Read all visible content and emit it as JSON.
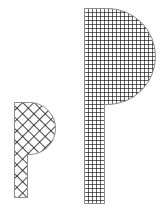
{
  "document": {
    "title": "Hatched P Glyphs",
    "background_color": "#ffffff",
    "width": 164,
    "height": 212
  },
  "chart_data": {
    "type": "diagram",
    "title": "",
    "xlabel": "",
    "ylabel": "",
    "background": "#ffffff",
    "shape_count": 2,
    "shapes": [
      {
        "id": "small-p",
        "label": "P",
        "role": "letterform",
        "pattern": "diagonal-crosshatch",
        "pattern_angle_degrees": 45,
        "pattern_pitch_px": 8,
        "stroke_color": "#1a1a1a",
        "stroke_width_px": 1.6,
        "outline_color": "#8c8c8c",
        "outline_width_px": 1,
        "fill_color": "#ffffff",
        "bbox": {
          "x": 14,
          "y": 102,
          "width": 41,
          "height": 96
        },
        "stem": {
          "x": 14,
          "y": 102,
          "width": 13,
          "height": 96
        },
        "bowl": {
          "x": 14,
          "y": 102,
          "width": 41,
          "height": 53,
          "right_radius": 26
        }
      },
      {
        "id": "large-p",
        "label": "P",
        "role": "letterform",
        "pattern": "orthogonal-grid",
        "pattern_angle_degrees": 0,
        "pattern_pitch_px": 4,
        "stroke_color": "#111111",
        "stroke_width_px": 1.3,
        "outline_color": "#8c8c8c",
        "outline_width_px": 1,
        "fill_color": "#ffffff",
        "bbox": {
          "x": 84,
          "y": 8,
          "width": 71,
          "height": 196
        },
        "stem": {
          "x": 84,
          "y": 8,
          "width": 20,
          "height": 196
        },
        "bowl": {
          "x": 84,
          "y": 8,
          "width": 71,
          "height": 96,
          "right_radius": 48
        }
      }
    ],
    "legend": [],
    "annotations": []
  }
}
